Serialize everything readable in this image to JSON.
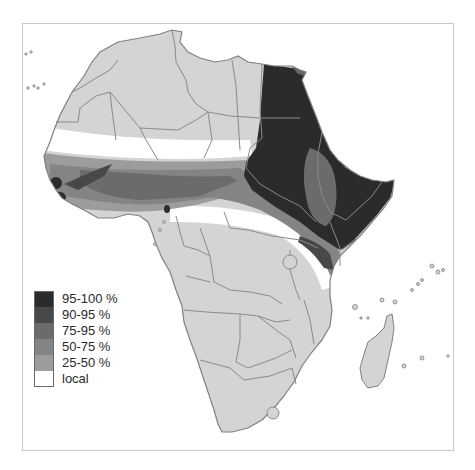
{
  "map": {
    "subject": "Africa",
    "frame": {
      "x": 22,
      "y": 23,
      "width": 432,
      "height": 428,
      "border_color": "#c8c8c8"
    },
    "colors": {
      "land_default": "#d4d4d4",
      "border": "#8a8a8a",
      "ocean": "#ffffff"
    }
  },
  "legend": {
    "items": [
      {
        "label": "95-100 %",
        "color": "#2b2b2b"
      },
      {
        "label": "90-95 %",
        "color": "#484848"
      },
      {
        "label": "75-95 %",
        "color": "#6b6b6b"
      },
      {
        "label": "50-75 %",
        "color": "#848484"
      },
      {
        "label": "25-50 %",
        "color": "#9c9c9c"
      },
      {
        "label": "local",
        "color": "#ffffff"
      }
    ]
  }
}
